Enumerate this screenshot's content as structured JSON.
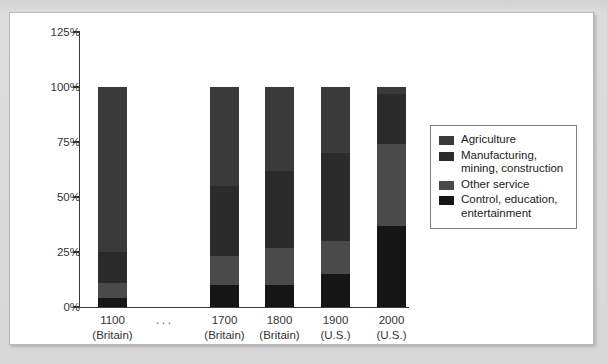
{
  "figure": {
    "background_color": "#d9d9d9",
    "panel_color": "#ffffff"
  },
  "chart_data": {
    "type": "bar",
    "subtype": "stacked-100-percent",
    "title": "",
    "xlabel": "",
    "ylabel": "",
    "grid": false,
    "ylim": [
      0,
      125
    ],
    "ytick_labels": [
      "125%",
      "100%",
      "75%",
      "50%",
      "25%",
      "0%"
    ],
    "ytick_values": [
      125,
      100,
      75,
      50,
      25,
      0
    ],
    "categories": [
      "1100\n(Britain)",
      "1700\n(Britain)",
      "1800\n(Britain)",
      "1900\n(U.S.)",
      "2000\n(U.S.)"
    ],
    "category_lines": [
      {
        "line1": "1100",
        "line2": "(Britain)"
      },
      {
        "line1": "1700",
        "line2": "(Britain)"
      },
      {
        "line1": "1800",
        "line2": "(Britain)"
      },
      {
        "line1": "1900",
        "line2": "(U.S.)"
      },
      {
        "line1": "2000",
        "line2": "(U.S.)"
      }
    ],
    "gap_marker": "...",
    "legend_position": "right",
    "series": [
      {
        "name": "Agriculture",
        "color": "#3a3a3a",
        "values": [
          75,
          45,
          38,
          30,
          3
        ]
      },
      {
        "name": "Manufacturing, mining, construction",
        "color": "#2b2b2b",
        "values": [
          14,
          32,
          35,
          40,
          23
        ]
      },
      {
        "name": "Other service",
        "color": "#4a4a4a",
        "values": [
          7,
          13,
          17,
          15,
          37
        ]
      },
      {
        "name": "Control, education, entertainment",
        "color": "#161616",
        "values": [
          4,
          10,
          10,
          15,
          37
        ]
      }
    ]
  },
  "legend": {
    "entries": [
      {
        "label": "Agriculture",
        "color": "#3a3a3a"
      },
      {
        "label": "Manufacturing, mining, construction",
        "color": "#2b2b2b"
      },
      {
        "label": "Other service",
        "color": "#4a4a4a"
      },
      {
        "label": "Control, education, entertainment",
        "color": "#161616"
      }
    ]
  }
}
